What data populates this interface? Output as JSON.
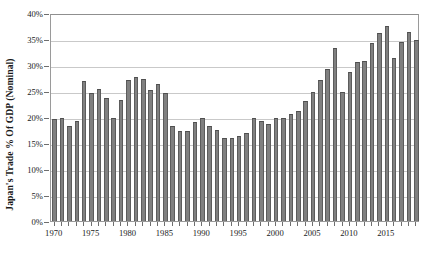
{
  "chart_data": {
    "type": "bar",
    "title": "",
    "xlabel": "",
    "ylabel": "Japan's Trade % Of GDP (Nominal)",
    "ylim": [
      0,
      40
    ],
    "ytick_labels": [
      "0%",
      "5%",
      "10%",
      "15%",
      "20%",
      "25%",
      "30%",
      "35%",
      "40%"
    ],
    "ytick_values": [
      0,
      5,
      10,
      15,
      20,
      25,
      30,
      35,
      40
    ],
    "xtick_labels": [
      "1970",
      "1975",
      "1980",
      "1985",
      "1990",
      "1995",
      "2000",
      "2005",
      "2010",
      "2015"
    ],
    "xtick_values": [
      1970,
      1975,
      1980,
      1985,
      1990,
      1995,
      2000,
      2005,
      2010,
      2015
    ],
    "grid": true,
    "legend": null,
    "bar_color": "#808080",
    "bar_edge_color": "#5c5c5c",
    "grid_color": "#c9c9c9",
    "axis_color": "#9a9a9a",
    "categories": [
      1970,
      1971,
      1972,
      1973,
      1974,
      1975,
      1976,
      1977,
      1978,
      1979,
      1980,
      1981,
      1982,
      1983,
      1984,
      1985,
      1986,
      1987,
      1988,
      1989,
      1990,
      1991,
      1992,
      1993,
      1994,
      1995,
      1996,
      1997,
      1998,
      1999,
      2000,
      2001,
      2002,
      2003,
      2004,
      2005,
      2006,
      2007,
      2008,
      2009,
      2010,
      2011,
      2012,
      2013,
      2014,
      2015,
      2016,
      2017,
      2018,
      2019
    ],
    "values": [
      19.6,
      19.9,
      18.2,
      19.3,
      26.9,
      24.6,
      25.4,
      23.7,
      19.8,
      23.2,
      27.2,
      27.6,
      27.3,
      25.2,
      26.4,
      24.7,
      18.2,
      17.3,
      17.3,
      19.0,
      19.8,
      18.2,
      17.5,
      16.0,
      16.0,
      16.4,
      17.0,
      19.9,
      19.3,
      18.6,
      19.9,
      19.9,
      20.6,
      21.2,
      23.1,
      24.8,
      27.2,
      29.3,
      33.3,
      24.9,
      28.6,
      30.6,
      30.8,
      34.2,
      36.2,
      37.5,
      31.3,
      34.4,
      36.3,
      34.9
    ]
  }
}
